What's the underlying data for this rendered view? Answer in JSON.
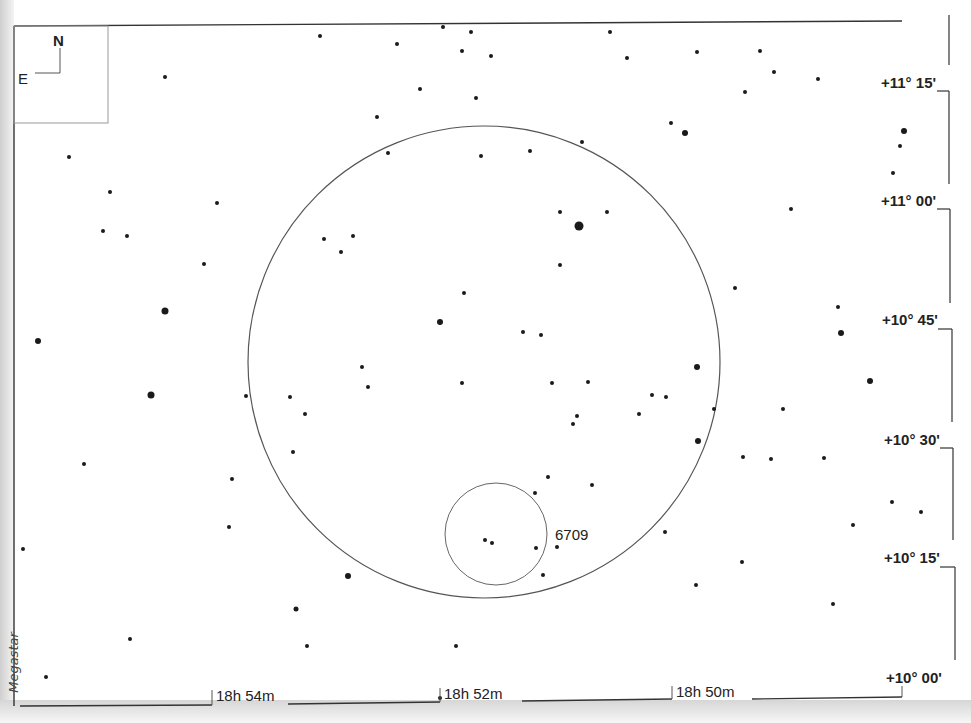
{
  "chart_title": "NGC 6709 finder chart",
  "credit": "Megastar",
  "compass": {
    "north": "N",
    "east": "E"
  },
  "object": {
    "label": "6709",
    "cx": 496,
    "cy": 534,
    "r": 51
  },
  "field_of_view": {
    "cx": 484,
    "cy": 362,
    "r": 236
  },
  "dec_labels": [
    {
      "text": "+11° 15'",
      "y": 83
    },
    {
      "text": "+11° 00'",
      "y": 201
    },
    {
      "text": "+10° 45'",
      "y": 320
    },
    {
      "text": "+10° 30'",
      "y": 440
    },
    {
      "text": "+10° 15'",
      "y": 558
    },
    {
      "text": "+10° 00'",
      "y": 678
    }
  ],
  "ra_labels": [
    {
      "text": "18h 54m",
      "x": 215
    },
    {
      "text": "18h 52m",
      "x": 443
    },
    {
      "text": "18h 50m",
      "x": 676
    }
  ],
  "stars": [
    [
      320,
      36,
      2
    ],
    [
      397,
      44,
      2
    ],
    [
      443,
      27,
      2
    ],
    [
      471,
      32,
      2
    ],
    [
      462,
      51,
      2
    ],
    [
      491,
      56,
      2
    ],
    [
      420,
      89,
      2
    ],
    [
      476,
      98,
      2
    ],
    [
      377,
      117,
      2
    ],
    [
      165,
      77,
      2
    ],
    [
      610,
      32,
      2
    ],
    [
      627,
      58,
      2
    ],
    [
      697,
      52,
      2
    ],
    [
      760,
      51,
      2
    ],
    [
      774,
      72,
      2
    ],
    [
      818,
      79,
      2
    ],
    [
      745,
      92,
      2
    ],
    [
      671,
      123,
      2
    ],
    [
      685,
      133,
      3
    ],
    [
      904,
      131,
      3
    ],
    [
      900,
      146,
      2
    ],
    [
      893,
      173,
      2
    ],
    [
      69,
      157,
      2
    ],
    [
      110,
      192,
      2
    ],
    [
      103,
      231,
      2
    ],
    [
      127,
      236,
      2
    ],
    [
      217,
      203,
      2
    ],
    [
      204,
      264,
      2
    ],
    [
      165,
      311,
      3.5
    ],
    [
      38,
      341,
      3
    ],
    [
      151,
      395,
      3.5
    ],
    [
      388,
      153,
      2
    ],
    [
      481,
      156,
      2
    ],
    [
      530,
      151,
      2
    ],
    [
      582,
      142,
      2
    ],
    [
      560,
      212,
      2
    ],
    [
      579,
      226,
      4.5
    ],
    [
      607,
      212,
      2
    ],
    [
      324,
      239,
      2
    ],
    [
      353,
      236,
      2
    ],
    [
      341,
      252,
      2
    ],
    [
      560,
      265,
      2
    ],
    [
      464,
      293,
      2
    ],
    [
      440,
      322,
      3
    ],
    [
      523,
      332,
      2
    ],
    [
      541,
      335,
      2
    ],
    [
      362,
      367,
      2
    ],
    [
      368,
      387,
      2
    ],
    [
      462,
      383,
      2
    ],
    [
      552,
      383,
      2
    ],
    [
      588,
      382,
      2
    ],
    [
      697,
      367,
      3
    ],
    [
      652,
      395,
      2
    ],
    [
      666,
      397,
      2
    ],
    [
      714,
      409,
      2
    ],
    [
      639,
      414,
      2
    ],
    [
      577,
      416,
      2
    ],
    [
      573,
      424,
      2
    ],
    [
      290,
      397,
      2
    ],
    [
      305,
      414,
      2
    ],
    [
      246,
      396,
      2
    ],
    [
      293,
      452,
      2
    ],
    [
      232,
      479,
      2
    ],
    [
      229,
      527,
      2
    ],
    [
      698,
      441,
      3
    ],
    [
      735,
      288,
      2
    ],
    [
      791,
      209,
      2
    ],
    [
      838,
      307,
      2
    ],
    [
      841,
      333,
      3
    ],
    [
      870,
      381,
      3
    ],
    [
      783,
      409,
      2
    ],
    [
      743,
      457,
      2
    ],
    [
      771,
      459,
      2
    ],
    [
      824,
      458,
      2
    ],
    [
      84,
      464,
      2
    ],
    [
      23,
      549,
      2
    ],
    [
      548,
      477,
      2
    ],
    [
      592,
      485,
      2
    ],
    [
      535,
      493,
      2
    ],
    [
      665,
      532,
      2
    ],
    [
      742,
      562,
      2
    ],
    [
      853,
      525,
      2
    ],
    [
      892,
      502,
      2
    ],
    [
      921,
      512,
      2
    ],
    [
      485,
      540,
      2
    ],
    [
      492,
      543,
      2
    ],
    [
      536,
      548,
      2
    ],
    [
      557,
      547,
      2
    ],
    [
      543,
      575,
      2
    ],
    [
      348,
      576,
      3
    ],
    [
      296,
      609,
      2.5
    ],
    [
      307,
      646,
      2
    ],
    [
      130,
      639,
      2
    ],
    [
      46,
      677,
      2
    ],
    [
      456,
      646,
      2
    ],
    [
      696,
      585,
      2
    ],
    [
      833,
      604,
      2
    ],
    [
      440,
      698,
      2
    ]
  ]
}
